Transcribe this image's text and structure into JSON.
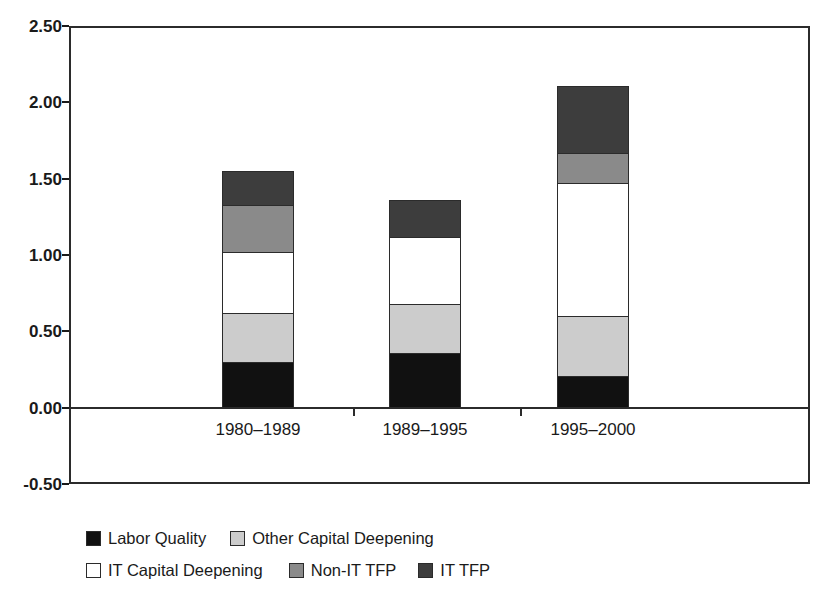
{
  "chart_data": {
    "type": "bar",
    "subtype": "stacked-bar",
    "title": "",
    "xlabel": "",
    "ylabel": "Annual Contribution (%)",
    "categories": [
      "1980–1989",
      "1989–1995",
      "1995–2000"
    ],
    "ylim": [
      -0.5,
      2.5
    ],
    "ytick_labels": [
      "2.50",
      "2.00",
      "1.50",
      "1.00",
      "0.50",
      "0.00",
      "-0.50"
    ],
    "ytick_values": [
      2.5,
      2.0,
      1.5,
      1.0,
      0.5,
      0.0,
      -0.5
    ],
    "grid": false,
    "legend_position": "bottom",
    "stack_order_bottom_to_top": [
      "Labor Quality",
      "Other Capital Deepening",
      "IT Capital Deepening",
      "Non-IT TFP",
      "IT TFP"
    ],
    "series": [
      {
        "name": "Labor Quality",
        "color": "#111111",
        "values": [
          0.3,
          0.36,
          0.21
        ]
      },
      {
        "name": "Other Capital Deepening",
        "color": "#cccccc",
        "values": [
          0.32,
          0.32,
          0.39
        ]
      },
      {
        "name": "IT Capital Deepening",
        "color": "#ffffff",
        "values": [
          0.4,
          0.44,
          0.87
        ]
      },
      {
        "name": "Non-IT TFP",
        "color": "#8a8a8a",
        "values": [
          0.31,
          0.0,
          0.2
        ]
      },
      {
        "name": "IT TFP",
        "color": "#3d3d3d",
        "values": [
          0.22,
          0.24,
          0.44
        ]
      }
    ],
    "totals": [
      1.55,
      1.36,
      2.11
    ]
  },
  "legend": {
    "entries": [
      {
        "label": "Labor Quality",
        "color": "#111111"
      },
      {
        "label": "Other Capital Deepening",
        "color": "#cccccc"
      },
      {
        "label": "IT Capital Deepening",
        "color": "#ffffff"
      },
      {
        "label": "Non-IT TFP",
        "color": "#8a8a8a"
      },
      {
        "label": "IT TFP",
        "color": "#3d3d3d"
      }
    ]
  },
  "colors": {
    "axis": "#2b2b2b",
    "text": "#1a1a1a",
    "background": "#ffffff"
  }
}
